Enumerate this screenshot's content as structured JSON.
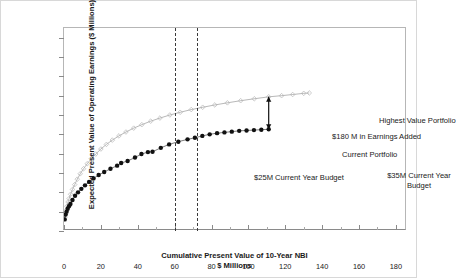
{
  "chart_data": {
    "type": "scatter",
    "title": "",
    "xlabel": "Cumulative Present Value of 10-Year NBI",
    "xlabel_line2": "$ Millions",
    "ylabel": "Expected Present Value of Operating Earnings ($ Millions)",
    "xlim": [
      0,
      186
    ],
    "ylim": [
      0,
      1050
    ],
    "xticks": [
      0,
      20,
      40,
      60,
      80,
      100,
      120,
      140,
      160,
      180
    ],
    "xtick_labels": [
      "0",
      "20",
      "40",
      "60",
      "80",
      "100",
      "120",
      "140",
      "160",
      "180"
    ],
    "yticks": [
      0,
      100,
      200,
      300,
      400,
      500,
      600,
      700,
      800,
      900,
      1000
    ],
    "ytick_labels": [
      "0",
      "100",
      "200",
      "300",
      "400",
      "500",
      "600",
      "700",
      "800",
      "900",
      "1,000"
    ],
    "grid": false,
    "legend": "none",
    "series": [
      {
        "name": "Highest Value Portfolio",
        "marker": "open-diamond",
        "color": "#b4b4b4",
        "line_color": "#9a9a9a",
        "points": [
          [
            0.4,
            70
          ],
          [
            1.0,
            105
          ],
          [
            1.6,
            128
          ],
          [
            2.2,
            150
          ],
          [
            2.8,
            168
          ],
          [
            3.6,
            190
          ],
          [
            4.6,
            215
          ],
          [
            5.8,
            240
          ],
          [
            7.2,
            268
          ],
          [
            8.8,
            296
          ],
          [
            10.6,
            322
          ],
          [
            12.6,
            348
          ],
          [
            14.8,
            374
          ],
          [
            17.2,
            398
          ],
          [
            20.0,
            424
          ],
          [
            23.0,
            448
          ],
          [
            26.2,
            470
          ],
          [
            29.8,
            492
          ],
          [
            33.6,
            512
          ],
          [
            37.8,
            532
          ],
          [
            42.2,
            550
          ],
          [
            47.0,
            568
          ],
          [
            52.0,
            584
          ],
          [
            57.4,
            600
          ],
          [
            63.0,
            614
          ],
          [
            69.0,
            628
          ],
          [
            75.2,
            640
          ],
          [
            81.8,
            652
          ],
          [
            88.6,
            663
          ],
          [
            95.8,
            674
          ],
          [
            103.2,
            684
          ],
          [
            111.0,
            694
          ],
          [
            118.0,
            700
          ],
          [
            124.0,
            706
          ],
          [
            130.0,
            712
          ],
          [
            133.0,
            714
          ]
        ]
      },
      {
        "name": "Current Portfolio",
        "marker": "filled-circle",
        "color": "#111111",
        "line_color": "#444444",
        "points": [
          [
            0.4,
            60
          ],
          [
            0.9,
            85
          ],
          [
            1.4,
            100
          ],
          [
            2.0,
            115
          ],
          [
            2.7,
            128
          ],
          [
            3.5,
            140
          ],
          [
            4.6,
            160
          ],
          [
            6.0,
            182
          ],
          [
            7.6,
            200
          ],
          [
            9.4,
            218
          ],
          [
            11.4,
            236
          ],
          [
            13.6,
            254
          ],
          [
            16.0,
            272
          ],
          [
            18.8,
            290
          ],
          [
            21.8,
            305
          ],
          [
            25.2,
            322
          ],
          [
            28.8,
            338
          ],
          [
            31.0,
            352
          ],
          [
            34.5,
            362
          ],
          [
            38.5,
            380
          ],
          [
            42.0,
            398
          ],
          [
            45.5,
            408
          ],
          [
            48.0,
            410
          ],
          [
            52.5,
            430
          ],
          [
            57.0,
            448
          ],
          [
            62.0,
            462
          ],
          [
            67.0,
            474
          ],
          [
            71.0,
            482
          ],
          [
            75.0,
            492
          ],
          [
            79.0,
            500
          ],
          [
            83.0,
            506
          ],
          [
            87.0,
            510
          ],
          [
            91.0,
            514
          ],
          [
            95.0,
            518
          ],
          [
            99.0,
            520
          ],
          [
            103.0,
            522
          ],
          [
            107.0,
            524
          ],
          [
            111.0,
            526
          ]
        ]
      }
    ],
    "reference_lines": [
      {
        "name": "current-portfolio-budget",
        "x": 111,
        "style": "dashed"
      },
      {
        "name": "highest-value-budget",
        "x": 133,
        "style": "dashed"
      }
    ],
    "arrow": {
      "x": 111,
      "y_bottom": 526,
      "y_top": 694,
      "double_headed": true
    }
  },
  "annotations": {
    "highest_value_portfolio": "Highest Value Portfolio",
    "earnings_added": "$180 M in Earnings Added",
    "current_portfolio": "Current Portfolio",
    "budget_25m": "$25M Current Year Budget",
    "budget_35m": "$35M Current Year Budget"
  }
}
